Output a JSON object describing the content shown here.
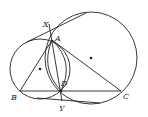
{
  "diagram": {
    "type": "geometry",
    "stroke_color": "#222222",
    "points": {
      "X": {
        "label": "X",
        "x": 49,
        "y": 24,
        "lx": 43,
        "ly": 27
      },
      "A": {
        "label": "A",
        "x": 52,
        "y": 40,
        "lx": 55,
        "ly": 41
      },
      "B": {
        "label": "B",
        "x": 20,
        "y": 91,
        "lx": 11,
        "ly": 100
      },
      "C": {
        "label": "C",
        "x": 121,
        "y": 91,
        "lx": 123,
        "ly": 99
      },
      "D": {
        "label": "D",
        "x": 61,
        "y": 91,
        "lx": 61,
        "ly": 86
      },
      "Y": {
        "label": "Y",
        "x": 62,
        "y": 101,
        "lx": 59,
        "ly": 111
      }
    },
    "circles": [
      {
        "name": "small-circle",
        "cx": 40,
        "cy": 69,
        "r": 30
      },
      {
        "name": "large-circle",
        "cx": 91,
        "cy": 58,
        "r": 46
      }
    ],
    "centers": [
      {
        "name": "small-circle-center",
        "x": 40,
        "y": 69
      },
      {
        "name": "large-circle-center",
        "x": 91,
        "y": 58
      }
    ],
    "labels": [
      "X",
      "A",
      "B",
      "C",
      "D",
      "Y"
    ]
  }
}
